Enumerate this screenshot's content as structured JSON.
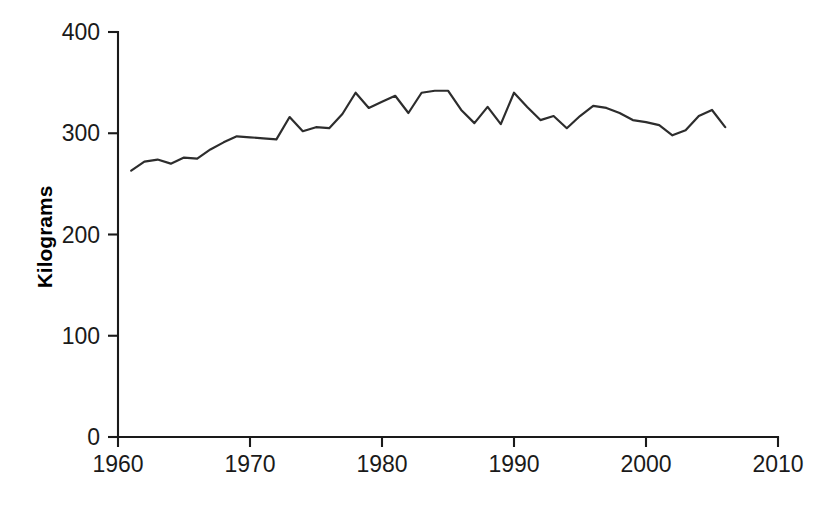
{
  "figure": {
    "background_color": "#ffffff",
    "line_color": "#2d2d2d",
    "axis_color": "#1a1a1a"
  },
  "axes": {
    "y_axis_title": "Kilograms",
    "y_tick_labels": [
      "0",
      "100",
      "200",
      "300",
      "400"
    ],
    "x_tick_labels": [
      "1960",
      "1970",
      "1980",
      "1990",
      "2000",
      "2010"
    ]
  },
  "chart_data": {
    "type": "line",
    "title": "",
    "subtitle": "",
    "xlabel": "",
    "ylabel": "Kilograms",
    "xlim": [
      1960,
      2010
    ],
    "ylim": [
      0,
      400
    ],
    "xticks": [
      1960,
      1970,
      1980,
      1990,
      2000,
      2010
    ],
    "yticks": [
      0,
      100,
      200,
      300,
      400
    ],
    "grid": false,
    "legend": false,
    "legend_position": "none",
    "series": [
      {
        "name": "Kilograms",
        "color": "#2d2d2d",
        "x": [
          1961,
          1962,
          1963,
          1964,
          1965,
          1966,
          1967,
          1968,
          1969,
          1970,
          1971,
          1972,
          1973,
          1974,
          1975,
          1976,
          1977,
          1978,
          1979,
          1980,
          1981,
          1982,
          1983,
          1984,
          1985,
          1986,
          1987,
          1988,
          1989,
          1990,
          1991,
          1992,
          1993,
          1994,
          1995,
          1996,
          1997,
          1998,
          1999,
          2000,
          2001,
          2002,
          2003,
          2004,
          2005,
          2006
        ],
        "values": [
          263,
          272,
          274,
          270,
          276,
          275,
          284,
          291,
          297,
          296,
          295,
          294,
          316,
          302,
          306,
          305,
          319,
          340,
          325,
          331,
          337,
          320,
          340,
          342,
          342,
          323,
          310,
          326,
          309,
          340,
          326,
          313,
          317,
          305,
          317,
          327,
          325,
          320,
          313,
          311,
          308,
          298,
          303,
          317,
          323,
          306
        ]
      }
    ]
  }
}
